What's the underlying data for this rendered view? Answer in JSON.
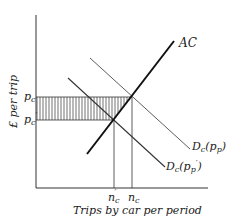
{
  "diagram": {
    "y_axis_label": "£ per trip",
    "x_axis_label": "Trips by car per period",
    "y_ticks": {
      "pc": {
        "base": "p",
        "sub": "c",
        "prime": false
      },
      "pc_prime": {
        "base": "p",
        "sub": "c",
        "prime": true
      }
    },
    "x_ticks": {
      "nc_prime": {
        "base": "n",
        "sub": "c",
        "prime": true
      },
      "nc": {
        "base": "n",
        "sub": "c",
        "prime": false
      }
    },
    "curves": {
      "ac": {
        "label": "AC"
      },
      "demand_pp": {
        "label_base": "D",
        "label_sub": "c",
        "arg_base": "p",
        "arg_sub": "p",
        "prime": false
      },
      "demand_pp_prime": {
        "label_base": "D",
        "label_sub": "c",
        "arg_base": "p",
        "arg_sub": "p",
        "prime": true
      }
    },
    "shaded_region": "hatched rectangle between p_c and p_c' from the y-axis to n_c",
    "colors": {
      "line": "#222222",
      "background": "#ffffff"
    }
  }
}
